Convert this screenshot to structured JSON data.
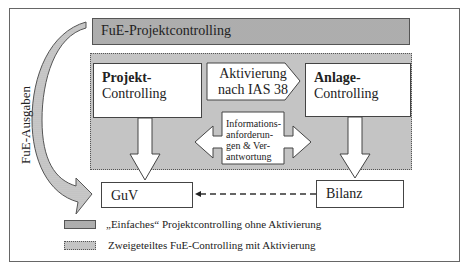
{
  "diagram": {
    "top_bar": {
      "label": "FuE-Projektcontrolling"
    },
    "side_arrow": {
      "label": "FuE-Ausgaben"
    },
    "projekt_box": {
      "bold": "Projekt-",
      "normal": "Controlling"
    },
    "aktivierung": {
      "line1": "Aktivierung",
      "line2": "nach IAS 38"
    },
    "anlage_box": {
      "bold": "Anlage-",
      "normal": "Controlling"
    },
    "info_arrow": {
      "line1": "Informations-",
      "line2": "anforderun-",
      "line3": "gen & Ver-",
      "line4": "antwortung"
    },
    "guv_box": {
      "label": "GuV"
    },
    "bilanz_box": {
      "label": "Bilanz"
    },
    "legend": [
      {
        "label": "„Einfaches“ Projektcontrolling ohne Aktivierung",
        "pattern": "dark-gray-solid-border"
      },
      {
        "label": "Zweigeteiltes FuE-Controlling mit Aktivierung",
        "pattern": "light-gray-dotted-border"
      }
    ],
    "colors": {
      "dark_fill": "#bdbdbd",
      "light_fill": "#dcdcdc",
      "border": "#555555"
    }
  }
}
